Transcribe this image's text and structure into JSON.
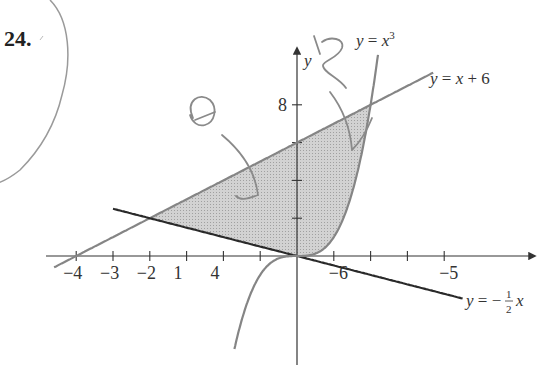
{
  "problem": {
    "number": "24."
  },
  "chart_data": {
    "type": "line",
    "title": "",
    "xlabel": "x",
    "ylabel": "y",
    "xlim": [
      -6.5,
      6.8
    ],
    "ylim": [
      -5.5,
      10.5
    ],
    "grid": false,
    "x_ticks": [
      -6,
      -5,
      -4,
      -3,
      -2,
      -1,
      1,
      2,
      3,
      4
    ],
    "x_tick_labels": [
      "−6",
      "−5",
      "−4",
      "−3",
      "−2",
      "1",
      "4"
    ],
    "y_ticks": [
      2,
      4,
      6,
      8
    ],
    "y_tick_labels": [
      "8"
    ],
    "series": [
      {
        "name": "y = x^3",
        "label": "y = x",
        "sup": "3",
        "expression": "x^3",
        "domain": [
          -1.7,
          2.2
        ],
        "color": "#808080"
      },
      {
        "name": "y = x + 6",
        "label": "y = x + 6",
        "expression": "x+6",
        "domain": [
          -6.6,
          3.7
        ],
        "color": "#808080"
      },
      {
        "name": "y = -1/2 x",
        "label_prefix": "y = −",
        "frac_num": "1",
        "frac_den": "2",
        "label_suffix": "x",
        "expression": "-x/2",
        "domain": [
          -5,
          4.5
        ],
        "color": "#2a2a2a"
      }
    ],
    "shaded_region": {
      "description": "Region bounded by y = x + 6 (top), y = -1/2 x (bottom left), and y = x^3 (right)",
      "vertices": [
        [
          -4,
          2
        ],
        [
          0,
          0
        ],
        [
          2,
          8
        ]
      ],
      "fill": "#c8c8c8"
    },
    "intersections": [
      [
        -4,
        2
      ],
      [
        0,
        0
      ],
      [
        2,
        8
      ]
    ]
  }
}
